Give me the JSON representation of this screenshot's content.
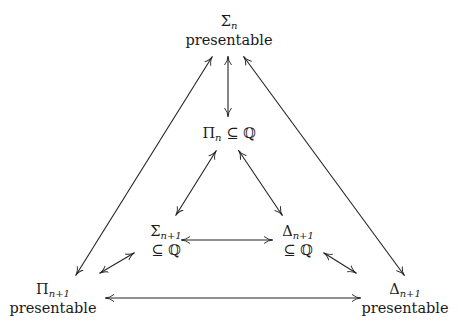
{
  "diagram": {
    "nodes": {
      "top": {
        "symbol": "Σ",
        "subscript": "n",
        "line2": "presentable"
      },
      "middle": {
        "symbol": "Π",
        "subscript": "n",
        "relation": " ⊆ ℚ"
      },
      "inner_left": {
        "symbol": "Σ",
        "subscript": "n+1",
        "line2": "⊆ ℚ"
      },
      "inner_right": {
        "symbol": "Δ",
        "subscript": "n+1",
        "line2": "⊆ ℚ"
      },
      "bottom_left": {
        "symbol": "Π",
        "subscript": "n+1",
        "line2": "presentable"
      },
      "bottom_right": {
        "symbol": "Δ",
        "subscript": "n+1",
        "line2": "presentable"
      }
    },
    "edges": [
      {
        "from": "top",
        "to": "bottom_left",
        "type": "double-arrow"
      },
      {
        "from": "top",
        "to": "bottom_right",
        "type": "double-arrow"
      },
      {
        "from": "top",
        "to": "middle",
        "type": "double-arrow"
      },
      {
        "from": "middle",
        "to": "inner_left",
        "type": "double-arrow"
      },
      {
        "from": "middle",
        "to": "inner_right",
        "type": "double-arrow"
      },
      {
        "from": "inner_left",
        "to": "inner_right",
        "type": "double-arrow"
      },
      {
        "from": "inner_left",
        "to": "bottom_left",
        "type": "double-arrow"
      },
      {
        "from": "inner_right",
        "to": "bottom_right",
        "type": "double-arrow"
      },
      {
        "from": "bottom_left",
        "to": "bottom_right",
        "type": "double-arrow"
      }
    ]
  }
}
